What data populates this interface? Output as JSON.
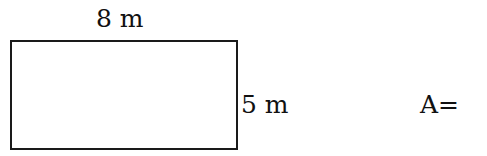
{
  "diagram": {
    "shape": "rectangle",
    "width_label": "8 m",
    "height_label": "5 m",
    "area_prompt": "A=",
    "colors": {
      "stroke": "#1a1a1a",
      "background": "#ffffff",
      "text": "#111111"
    }
  }
}
